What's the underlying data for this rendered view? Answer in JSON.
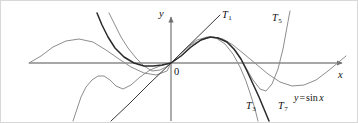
{
  "figure": {
    "background_color": "#ffffff",
    "border_color": "#d8d8d8"
  },
  "axes": {
    "x_axis_label": "x",
    "y_axis_label": "y",
    "origin_label": "0",
    "axis_color": "#8a8a8a",
    "x_axis_y_px": 62,
    "y_axis_x_px": 170,
    "x_axis_start_px": 28,
    "x_axis_end_px": 345,
    "y_axis_top_px": 12,
    "y_axis_bottom_px": 120
  },
  "curve_labels": [
    {
      "name": "T1",
      "base": "T",
      "subscript": "1",
      "x_px": 221,
      "y_px": 9
    },
    {
      "name": "T5",
      "base": "T",
      "subscript": "5",
      "x_px": 271,
      "y_px": 12
    },
    {
      "name": "T3",
      "base": "T",
      "subscript": "3",
      "x_px": 245,
      "y_px": 100
    },
    {
      "name": "T7",
      "base": "T",
      "subscript": "7",
      "x_px": 277,
      "y_px": 100
    }
  ],
  "function_label": {
    "y": "y",
    "equals": "=",
    "fn": "sin",
    "arg": "x",
    "x_px": 293,
    "y_px": 92
  },
  "colors": {
    "sine_curve": "#8d8d8d",
    "taylor_light": "#8d8d8d",
    "taylor_dark": "#2b2b2b",
    "taylor_mid": "#555555",
    "axis": "#8a8a8a",
    "text": "#111111"
  },
  "chart_data": {
    "type": "line",
    "xlabel": "x",
    "ylabel": "y",
    "grid": false,
    "legend": "inline-curve-labels",
    "origin_px": {
      "x": 170,
      "y": 62
    },
    "scale_px_per_unit": {
      "x": 22.3,
      "y": 33.0
    },
    "xlim": [
      -6.4,
      7.8
    ],
    "ylim": [
      -1.5,
      1.5
    ],
    "series": [
      {
        "name": "y = sin x",
        "color": "#8d8d8d",
        "width": 1.0,
        "label": "y = sin x",
        "points_px": "28,62 40,55 52,46 65,40 78,38 92,41 105,49 118,58 130,66 143,72 155,74 166,70 170,62 178,54 190,44 202,38 212,36 222,38 232,44 243,53 255,63 267,73 279,81 291,85 303,84 315,79 327,70 339,60 345,55"
      },
      {
        "name": "T1",
        "color": "#3a3a3a",
        "width": 1.0,
        "label": "T1",
        "points_px": "219,14 170,62 149,82 128,103 110,120"
      },
      {
        "name": "T3",
        "color": "#8d8d8d",
        "width": 1.0,
        "label": "T3",
        "points_px": "108,12 114,24 120,36 127,47 135,57 143,65 151,70 159,69 165,66 170,62 177,55 186,46 196,39 206,36 215,37 224,43 232,53 239,66 245,80 250,95 254,108 257,120"
      },
      {
        "name": "T5",
        "color": "#8d8d8d",
        "width": 1.0,
        "label": "T5",
        "points_px": "72,120 76,108 80,96 85,86 91,79 97,75 103,75 109,79 115,85 122,88 130,84 139,76 149,69 159,65 170,62 180,55 190,46 200,39 209,36 218,37 227,42 236,52 244,65 252,79 259,88 265,90 271,83 277,68 282,48 286,26 289,10"
      },
      {
        "name": "T7",
        "color": "#2b2b2b",
        "width": 1.5,
        "label": "T7",
        "points_px": "96,12 101,24 107,36 114,47 123,56 133,62 143,65 152,65 161,64 170,62 180,55 190,46 200,39 209,36 217,37 226,41 233,48 240,58 246,70 252,83 258,96 263,108 268,120"
      }
    ]
  }
}
